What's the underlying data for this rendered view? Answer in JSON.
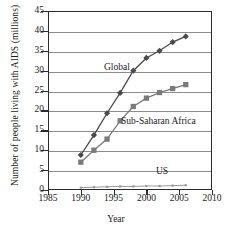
{
  "chart_data": {
    "type": "line",
    "title": "",
    "xlabel": "Year",
    "ylabel": "Number of people living with AIDS (millions)",
    "xlim": [
      1985,
      2010
    ],
    "ylim": [
      0,
      45
    ],
    "xticks": [
      1985,
      1990,
      1995,
      2000,
      2005,
      2010
    ],
    "yticks": [
      0,
      5,
      10,
      15,
      20,
      25,
      30,
      35,
      40,
      45
    ],
    "grid": "horizontal",
    "legend": "inline-annotations",
    "x": [
      1990,
      1992,
      1994,
      1996,
      1998,
      2000,
      2002,
      2004,
      2006
    ],
    "series": [
      {
        "name": "Global",
        "marker": "diamond",
        "color": "#4a4a4a",
        "values": [
          8.8,
          13.8,
          19.3,
          24.4,
          30.0,
          33.2,
          35.0,
          37.2,
          38.6
        ]
      },
      {
        "name": "Sub-Saharan Africa",
        "marker": "square",
        "color": "#7a7a7a",
        "values": [
          7.0,
          10.0,
          12.8,
          17.4,
          21.0,
          23.1,
          24.5,
          25.5,
          26.5
        ]
      },
      {
        "name": "US",
        "marker": "square",
        "color": "#9a9a9a",
        "values": [
          0.6,
          0.7,
          0.8,
          0.9,
          0.9,
          1.0,
          1.0,
          1.1,
          1.2
        ]
      }
    ],
    "annotations": [
      {
        "text": "Global",
        "x": 1996,
        "y": 31
      },
      {
        "text": "Sub-Saharan Africa",
        "x": 2000,
        "y": 18
      },
      {
        "text": "US",
        "x": 2003,
        "y": 4
      }
    ]
  },
  "axis": {
    "y_title": "Number of people living with AIDS (millions)",
    "x_title": "Year",
    "y_labels": [
      "45",
      "40",
      "35",
      "30",
      "25",
      "20",
      "15",
      "10",
      "5",
      "0"
    ],
    "x_labels": [
      "1985",
      "1990",
      "1995",
      "2000",
      "2005",
      "2010"
    ]
  },
  "labels": {
    "global": "Global",
    "ssa": "Sub-Saharan Africa",
    "us": "US"
  }
}
